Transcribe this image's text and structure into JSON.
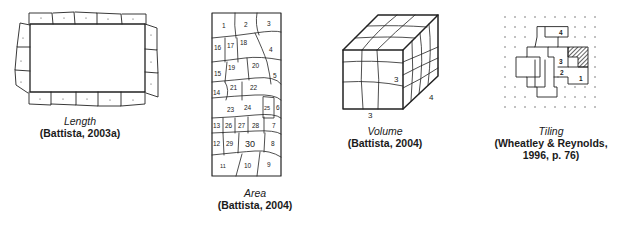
{
  "figure": {
    "panels": [
      {
        "id": "length",
        "title": "Length",
        "source": "(Battista, 2003a)"
      },
      {
        "id": "area",
        "title": "Area",
        "source": "(Battista, 2004)",
        "cell_labels": [
          "1",
          "2",
          "3",
          "16",
          "17",
          "18",
          "4",
          "19",
          "20",
          "15",
          "5",
          "14",
          "21",
          "22",
          "23",
          "24",
          "25",
          "6",
          "13",
          "26",
          "27",
          "28",
          "7",
          "12",
          "29",
          "30",
          "8",
          "11",
          "10",
          "9"
        ]
      },
      {
        "id": "volume",
        "title": "Volume",
        "source": "(Battista, 2004)",
        "dimension_labels": [
          "3",
          "4",
          "3"
        ]
      },
      {
        "id": "tiling",
        "title": "Tiling",
        "source_line1": "(Wheatley & Reynolds,",
        "source_line2": "1996, p. 76)",
        "piece_labels": [
          "4",
          "3",
          "2",
          "1"
        ]
      }
    ]
  }
}
